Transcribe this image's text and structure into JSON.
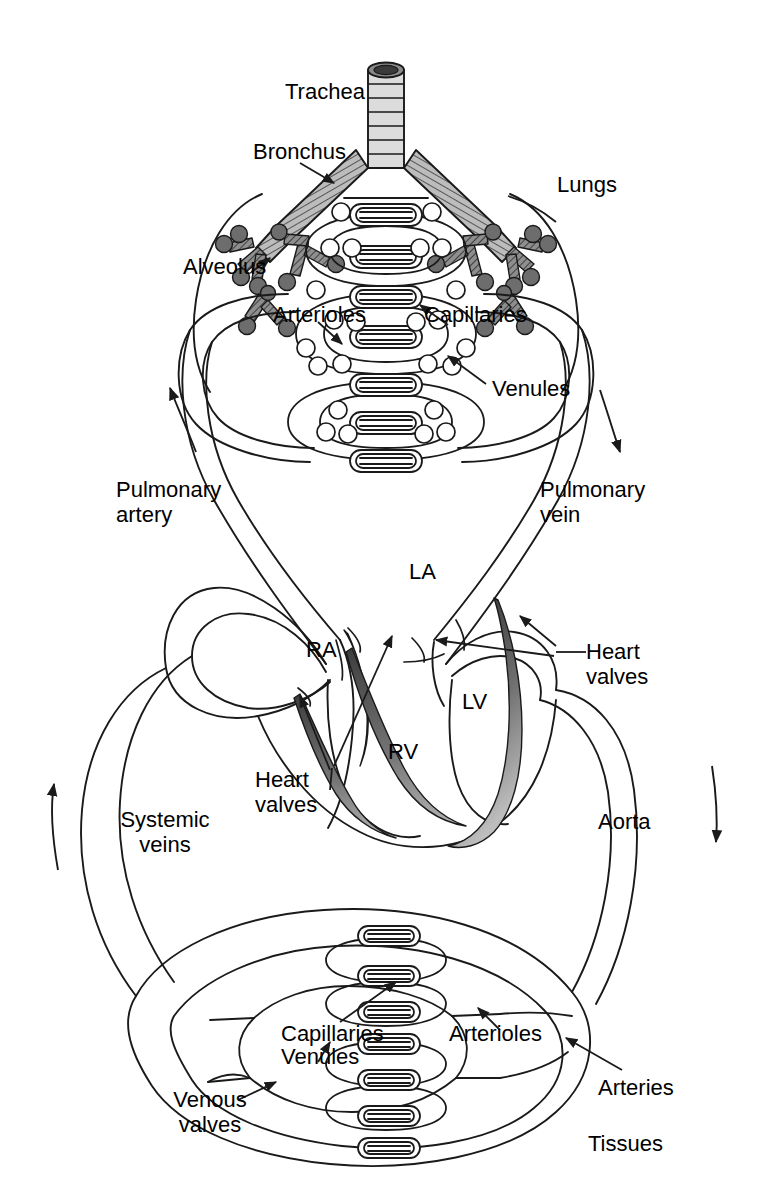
{
  "figure": {
    "type": "anatomical-schematic",
    "ink_color": "#1a1a1a",
    "background_color": "#ffffff",
    "valve_fill_dark": "#4a4a4a",
    "valve_fill_light": "#9a9a9a",
    "bronchus_fill": "#b5b5b5",
    "alveolus_fill": "#707070",
    "trachea_fill": "#d8d8d8"
  },
  "labels": {
    "trachea": "Trachea",
    "bronchus": "Bronchus",
    "lungs": "Lungs",
    "alveolus": "Alveolus",
    "arterioles_lung": "Arterioles",
    "capillaries_lung": "Capillaries",
    "venules_lung": "Venules",
    "pulmonary_artery": "Pulmonary\nartery",
    "pulmonary_vein": "Pulmonary\nvein",
    "right_atrium": "RA",
    "left_atrium": "LA",
    "right_ventricle": "RV",
    "left_ventricle": "LV",
    "heart_valves_right": "Heart\nvalves",
    "heart_valves_left": "Heart\nvalves",
    "systemic_veins": "Systemic\nveins",
    "aorta": "Aorta",
    "capillaries_tissue": "Capillaries",
    "venules_tissue": "Venules",
    "arterioles_tissue": "Arterioles",
    "arteries": "Arteries",
    "venous_valves": "Venous\nvalves",
    "tissues": "Tissues"
  },
  "flow_arrows": [
    {
      "name": "pulmonary-artery-flow",
      "direction": "up-left",
      "region": "left-upper"
    },
    {
      "name": "pulmonary-vein-flow",
      "direction": "down-right",
      "region": "right-upper"
    },
    {
      "name": "systemic-vein-flow",
      "direction": "up",
      "region": "left-lower"
    },
    {
      "name": "aorta-flow",
      "direction": "down",
      "region": "right-lower"
    }
  ],
  "pointer_arrows": [
    {
      "name": "bronchus-pointer",
      "target": "bronchus"
    },
    {
      "name": "alveolus-pointer",
      "target": "alveolus"
    },
    {
      "name": "arterioles-lung-pointer",
      "target": "arterioles"
    },
    {
      "name": "capillaries-lung-pointer",
      "target": "capillaries"
    },
    {
      "name": "venules-lung-pointer",
      "target": "venules"
    },
    {
      "name": "heart-valves-right-pointer-1",
      "target": "tricuspid-valve"
    },
    {
      "name": "heart-valves-right-pointer-2",
      "target": "pulmonary-valve"
    },
    {
      "name": "heart-valves-left-pointer-1",
      "target": "mitral-valve"
    },
    {
      "name": "heart-valves-left-pointer-2",
      "target": "aortic-valve"
    },
    {
      "name": "capillaries-tissue-pointer",
      "target": "capillaries"
    },
    {
      "name": "venules-tissue-pointer",
      "target": "venules"
    },
    {
      "name": "arterioles-tissue-pointer",
      "target": "arterioles"
    },
    {
      "name": "arteries-pointer",
      "target": "arteries"
    },
    {
      "name": "venous-valves-pointer",
      "target": "venous-valves"
    }
  ]
}
